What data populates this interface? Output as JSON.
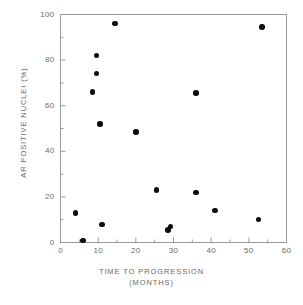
{
  "chart_data": {
    "type": "scatter",
    "title": "",
    "xlabel": "TIME TO PROGRESSION",
    "xlabel_sub": "(MONTHS)",
    "ylabel": "AR POSITIVE NUCLEI (%)",
    "xlim": [
      0,
      60
    ],
    "ylim": [
      0,
      100
    ],
    "xticks": [
      0,
      10,
      20,
      30,
      40,
      50,
      60
    ],
    "yticks": [
      0,
      20,
      40,
      60,
      80,
      100
    ],
    "xtick_labels": [
      "0",
      "10",
      "20",
      "30",
      "40",
      "50",
      "60"
    ],
    "ytick_labels": [
      "0",
      "20",
      "40",
      "60",
      "80",
      "100"
    ],
    "grid": false,
    "legend": false,
    "marker_color": "#0d0d0d",
    "frame_color": "#9a9a9a",
    "points": [
      {
        "x": 4.0,
        "y": 13.0
      },
      {
        "x": 6.0,
        "y": 1.0
      },
      {
        "x": 8.5,
        "y": 66.0
      },
      {
        "x": 9.5,
        "y": 82.0
      },
      {
        "x": 9.5,
        "y": 74.0
      },
      {
        "x": 10.5,
        "y": 52.0
      },
      {
        "x": 11.0,
        "y": 8.0
      },
      {
        "x": 14.5,
        "y": 96.0
      },
      {
        "x": 20.0,
        "y": 48.5
      },
      {
        "x": 25.5,
        "y": 23.0
      },
      {
        "x": 28.5,
        "y": 5.5
      },
      {
        "x": 29.2,
        "y": 7.0
      },
      {
        "x": 36.0,
        "y": 65.5
      },
      {
        "x": 36.0,
        "y": 22.0
      },
      {
        "x": 41.0,
        "y": 14.0
      },
      {
        "x": 52.5,
        "y": 10.0
      },
      {
        "x": 53.5,
        "y": 94.5
      }
    ]
  }
}
